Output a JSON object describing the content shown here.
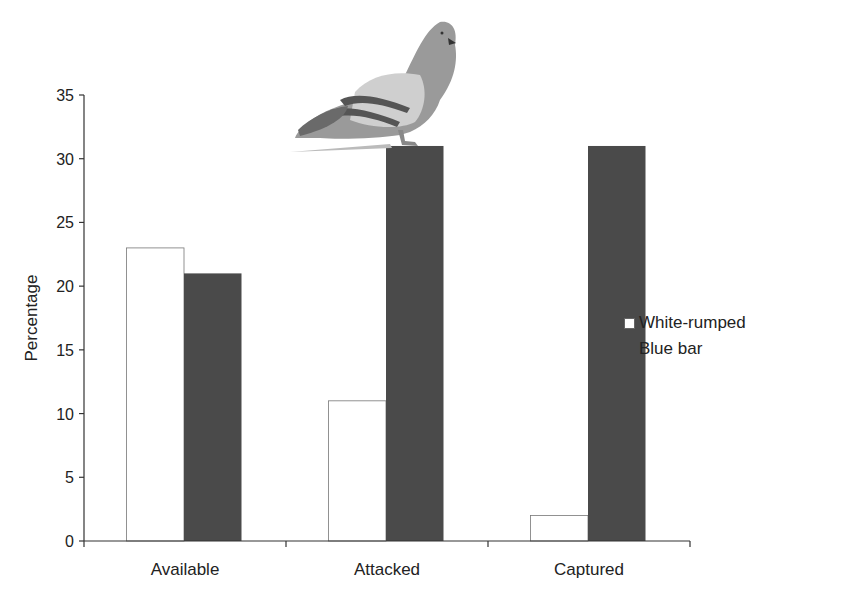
{
  "chart_data": {
    "type": "bar",
    "title": "",
    "xlabel": "",
    "ylabel": "Percentage",
    "categories": [
      "Available",
      "Attacked",
      "Captured"
    ],
    "series": [
      {
        "name": "White-rumped",
        "values": [
          23,
          11,
          2
        ],
        "color": "#ffffff"
      },
      {
        "name": "Blue bar",
        "values": [
          21,
          31,
          31
        ],
        "color": "#4a4a4a"
      }
    ],
    "ylim": [
      0,
      35
    ],
    "yticks": [
      0,
      5,
      10,
      15,
      20,
      25,
      30,
      35
    ],
    "grid": false,
    "legend_position": "right",
    "annotation": "pigeon illustration perched on Attacked Blue bar column"
  },
  "legend": {
    "items": [
      {
        "label": "White-rumped"
      },
      {
        "label": "Blue bar"
      }
    ]
  }
}
